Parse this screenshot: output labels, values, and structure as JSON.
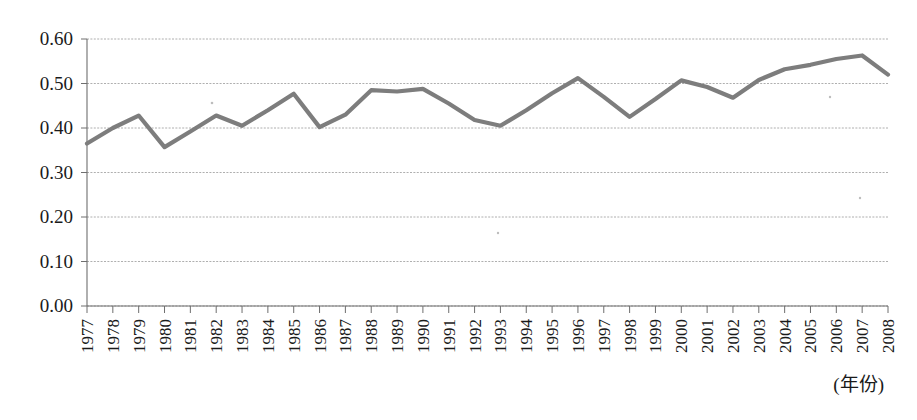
{
  "chart_data": {
    "type": "line",
    "title": "",
    "subtitle": "",
    "xlabel": "(年份)",
    "ylabel": "",
    "grid": true,
    "legend": null,
    "line_color": "#7d7d7d",
    "xlim_categories": [
      "1977",
      "2008"
    ],
    "ylim": [
      0.0,
      0.6
    ],
    "ytick_labels": [
      "0.00",
      "0.10",
      "0.20",
      "0.30",
      "0.40",
      "0.50",
      "0.60"
    ],
    "ytick_values": [
      0.0,
      0.1,
      0.2,
      0.3,
      0.4,
      0.5,
      0.6
    ],
    "categories": [
      "1977",
      "1978",
      "1979",
      "1980",
      "1981",
      "1982",
      "1983",
      "1984",
      "1985",
      "1986",
      "1987",
      "1988",
      "1989",
      "1990",
      "1991",
      "1992",
      "1993",
      "1994",
      "1995",
      "1996",
      "1997",
      "1998",
      "1999",
      "2000",
      "2001",
      "2002",
      "2003",
      "2004",
      "2005",
      "2006",
      "2007",
      "2008"
    ],
    "values": [
      0.365,
      0.4,
      0.428,
      0.357,
      0.392,
      0.428,
      0.405,
      0.44,
      0.477,
      0.402,
      0.43,
      0.485,
      0.482,
      0.488,
      0.455,
      0.418,
      0.405,
      0.44,
      0.478,
      0.512,
      0.47,
      0.425,
      0.465,
      0.507,
      0.492,
      0.468,
      0.508,
      0.532,
      0.542,
      0.555,
      0.563,
      0.52
    ]
  },
  "axes": {
    "x_caption": "(年份)",
    "y_axis_name": "value-axis",
    "x_axis_name": "year-axis"
  }
}
